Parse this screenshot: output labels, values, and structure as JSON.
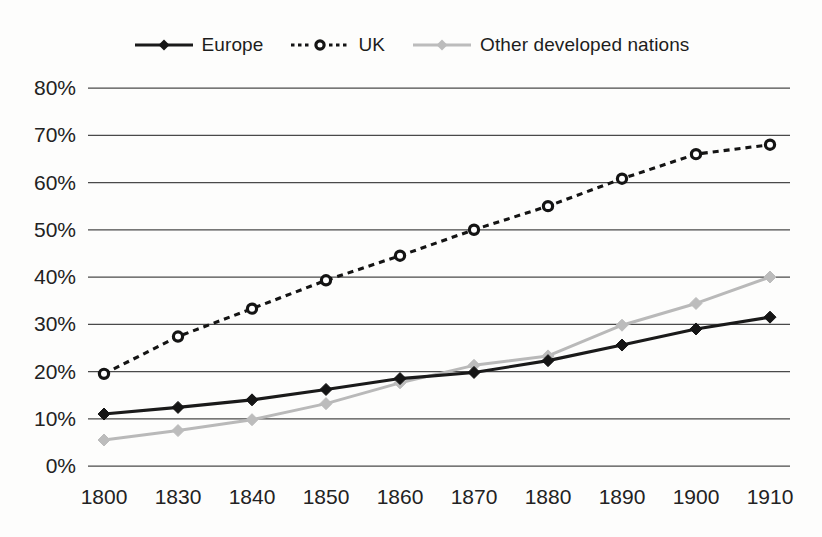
{
  "chart_data": {
    "type": "line",
    "title": "",
    "subtitle": "",
    "xlabel": "",
    "ylabel": "",
    "categories": [
      "1800",
      "1830",
      "1840",
      "1850",
      "1860",
      "1870",
      "1880",
      "1890",
      "1900",
      "1910"
    ],
    "x_tick_labels": [
      "1800",
      "1830",
      "1840",
      "1850",
      "1860",
      "1870",
      "1880",
      "1890",
      "1900",
      "1910"
    ],
    "y_tick_labels": [
      "0%",
      "10%",
      "20%",
      "30%",
      "40%",
      "50%",
      "60%",
      "70%",
      "80%"
    ],
    "y_tick_values": [
      0,
      10,
      20,
      30,
      40,
      50,
      60,
      70,
      80
    ],
    "ylim": [
      0,
      80
    ],
    "y_unit": "%",
    "grid": "horizontal",
    "legend_position": "top-center",
    "series": [
      {
        "name": "Europe",
        "color": "#1a1a1a",
        "line_style": "solid",
        "marker": "filled-diamond",
        "values": [
          11.0,
          12.4,
          14.0,
          16.2,
          18.5,
          19.8,
          22.3,
          25.6,
          29.0,
          31.5
        ]
      },
      {
        "name": "UK",
        "color": "#141414",
        "line_style": "dotted",
        "marker": "open-circle",
        "values": [
          19.5,
          27.4,
          33.3,
          39.3,
          44.5,
          50.0,
          55.0,
          60.8,
          66.0,
          68.0
        ]
      },
      {
        "name": "Other developed nations",
        "color": "#bcbcbc",
        "line_style": "solid",
        "marker": "filled-diamond",
        "values": [
          5.5,
          7.5,
          9.8,
          13.2,
          17.6,
          21.3,
          23.3,
          29.8,
          34.4,
          40.0
        ]
      }
    ]
  },
  "legend": {
    "items": [
      {
        "label": "Europe",
        "key": "europe"
      },
      {
        "label": "UK",
        "key": "uk"
      },
      {
        "label": "Other developed nations",
        "key": "other"
      }
    ]
  },
  "colors": {
    "europe": "#1a1a1a",
    "uk": "#141414",
    "other": "#bcbcbc",
    "grid": "#4a4a4a",
    "text": "#222222",
    "background": "#fdfdfc"
  }
}
